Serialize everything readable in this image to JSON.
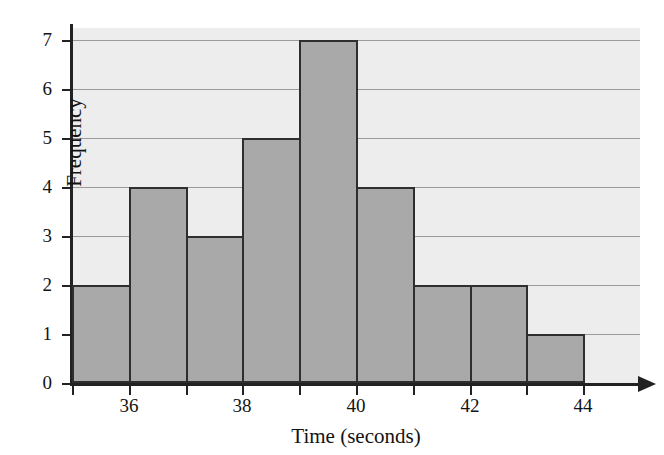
{
  "chart_data": {
    "type": "bar",
    "title": "",
    "subtitle": "",
    "xlabel": "Time (seconds)",
    "ylabel": "Frequency",
    "categories": [
      "35-36",
      "36-37",
      "37-38",
      "38-39",
      "39-40",
      "40-41",
      "41-42",
      "42-43",
      "43-44"
    ],
    "bin_edges": [
      35,
      36,
      37,
      38,
      39,
      40,
      41,
      42,
      43,
      44
    ],
    "values": [
      2,
      4,
      3,
      5,
      7,
      4,
      2,
      2,
      1
    ],
    "x_tick_values": [
      35,
      36,
      37,
      38,
      39,
      40,
      41,
      42,
      43,
      44
    ],
    "x_tick_labels": [
      "",
      "36",
      "",
      "38",
      "",
      "40",
      "",
      "42",
      "",
      "44"
    ],
    "y_tick_values": [
      0,
      1,
      2,
      3,
      4,
      5,
      6,
      7
    ],
    "y_tick_labels": [
      "0",
      "1",
      "2",
      "3",
      "4",
      "5",
      "6",
      "7"
    ],
    "xlim": [
      35,
      45
    ],
    "ylim": [
      0,
      7.25
    ],
    "grid": "horizontal",
    "legend": "none",
    "bar_fill_color": "#a9a9a9",
    "bar_edge_color": "#2e2e2e",
    "plot_background_color": "#ededed",
    "gridline_color": "#9a9a9a",
    "axis_color": "#222222",
    "text_color": "#131313",
    "x_axis_has_arrow": true
  }
}
